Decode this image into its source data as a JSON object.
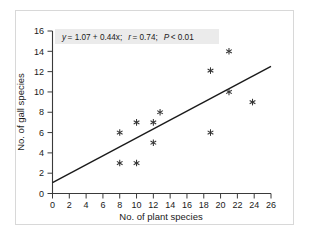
{
  "chart_data": {
    "type": "scatter",
    "title": "",
    "xlabel": "No. of plant species",
    "ylabel": "No. of gall species",
    "xlim": [
      0,
      26
    ],
    "ylim": [
      0,
      16
    ],
    "xticks": [
      0,
      2,
      4,
      6,
      8,
      10,
      12,
      14,
      16,
      18,
      20,
      22,
      24,
      26
    ],
    "yticks": [
      0,
      2,
      4,
      6,
      8,
      10,
      12,
      14,
      16
    ],
    "grid": false,
    "legend": null,
    "marker_symbol": "asterisk",
    "points": [
      {
        "x": 8.0,
        "y": 6.0
      },
      {
        "x": 8.0,
        "y": 3.0
      },
      {
        "x": 10.0,
        "y": 7.0
      },
      {
        "x": 10.0,
        "y": 3.0
      },
      {
        "x": 12.0,
        "y": 7.0
      },
      {
        "x": 12.0,
        "y": 5.0
      },
      {
        "x": 12.8,
        "y": 8.0
      },
      {
        "x": 18.8,
        "y": 12.1
      },
      {
        "x": 18.8,
        "y": 6.0
      },
      {
        "x": 21.0,
        "y": 14.0
      },
      {
        "x": 21.0,
        "y": 10.0
      },
      {
        "x": 23.8,
        "y": 9.0
      }
    ],
    "fit_line": {
      "intercept": 1.07,
      "slope": 0.44,
      "x_start": 0,
      "x_end": 26,
      "y_start": 1.07,
      "y_end": 12.51
    },
    "annotation": {
      "equation_y": "y",
      "equation_rest": "= 1.07 + 0.44x;",
      "r_symbol": "r",
      "r_value": "= 0.74;",
      "p_symbol": "P",
      "p_value": "< 0.01",
      "full_text": "y = 1.07 + 0.44x;   r = 0.74;   P < 0.01"
    },
    "colors": {
      "axis": "#3a3a3a",
      "line": "#1a1a1a",
      "marker": "#333333",
      "annotation_background": "#ebebeb",
      "figure_border": "#d8d8d8",
      "background": "#ffffff"
    }
  }
}
